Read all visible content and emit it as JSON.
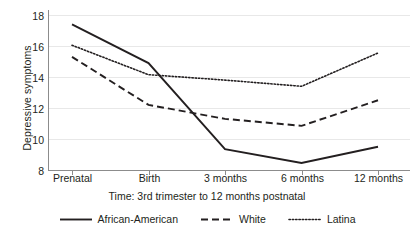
{
  "chart_data": {
    "type": "line",
    "title": "",
    "xlabel": "Time: 3rd trimester to 12 months postnatal",
    "ylabel": "Depressive symptoms",
    "categories": [
      "Prenatal",
      "Birth",
      "3 months",
      "6 months",
      "12 months"
    ],
    "ylim": [
      8,
      18
    ],
    "yticks": [
      8,
      10,
      12,
      14,
      16,
      18
    ],
    "ytick_labels": [
      "8",
      "10",
      "12",
      "14",
      "16",
      "18"
    ],
    "grid": true,
    "grid_axis": "y",
    "legend_position": "bottom",
    "series": [
      {
        "name": "African-American",
        "style": "solid",
        "color": "#231f20",
        "values": [
          17.4,
          14.9,
          9.35,
          8.45,
          9.5
        ]
      },
      {
        "name": "White",
        "style": "dashed",
        "color": "#231f20",
        "values": [
          15.3,
          12.2,
          11.3,
          10.85,
          12.5
        ]
      },
      {
        "name": "Latina",
        "style": "dotted",
        "color": "#231f20",
        "values": [
          16.05,
          14.15,
          13.8,
          13.4,
          15.55
        ]
      }
    ]
  },
  "axes": {
    "y_title": "Depressive symptoms",
    "x_title": "Time: 3rd trimester to 12 months postnatal",
    "y_ticks": [
      "18",
      "16",
      "14",
      "12",
      "10",
      "8"
    ],
    "x_ticks": [
      "Prenatal",
      "Birth",
      "3 months",
      "6 months",
      "12 months"
    ]
  },
  "legend": {
    "items": [
      {
        "label": "African-American",
        "style": "solid"
      },
      {
        "label": "White",
        "style": "dashed"
      },
      {
        "label": "Latina",
        "style": "dotted"
      }
    ]
  },
  "colors": {
    "line": "#231f20",
    "axis": "#8c8c8c",
    "grid": "#e8e8e8",
    "background": "#ffffff"
  }
}
